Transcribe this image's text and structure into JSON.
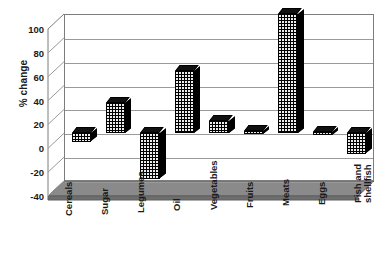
{
  "chart_data": {
    "type": "bar",
    "title": "",
    "subtitle": "",
    "xlabel": "",
    "ylabel": "% change",
    "categories": [
      "Cereals",
      "Sugar",
      "Legumes",
      "Oil",
      "Vegetables",
      "Fruits",
      "Meats",
      "Eggs",
      "Fish and\nshellfish"
    ],
    "values": [
      -7,
      25,
      -38,
      52,
      10,
      2,
      100,
      1,
      -17
    ],
    "ylim": [
      -40,
      100
    ],
    "yticks": [
      100,
      80,
      60,
      40,
      20,
      0,
      -20,
      -40
    ],
    "ytick_labels": [
      "100",
      "80",
      "60",
      "40",
      "20",
      "0",
      "-20",
      "-40"
    ],
    "grid": true,
    "legend": false,
    "legend_position": "none",
    "style": "3d-column",
    "bar_color": "#000000",
    "bar_pattern": "dotted",
    "floor_color": "#7a7a7a",
    "frame_color": "#7d7d7d",
    "gridline_color": "#9a9a9a",
    "background_color": "#ffffff",
    "series": [
      {
        "name": "% change",
        "values": [
          -7,
          25,
          -38,
          52,
          10,
          2,
          100,
          1,
          -17
        ]
      }
    ]
  },
  "axis": {
    "y_title": "% change"
  }
}
